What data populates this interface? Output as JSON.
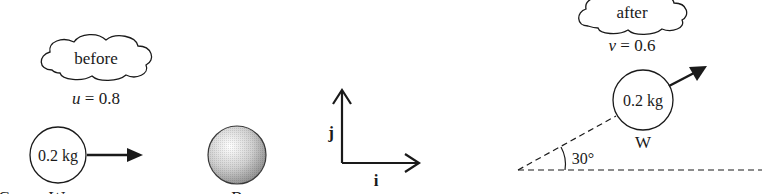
{
  "diagram": {
    "before": {
      "cloud_label": "before",
      "velocity_symbol": "u",
      "velocity_text": "u = 0.8",
      "ball_w": {
        "mass_label": "0.2 kg",
        "name": "W"
      },
      "ball_b": {
        "name": "B"
      },
      "edge_label": "C"
    },
    "axes": {
      "x_label": "i",
      "y_label": "j"
    },
    "after": {
      "cloud_label": "after",
      "velocity_symbol": "v",
      "velocity_text": "v = 0.6",
      "ball_w": {
        "mass_label": "0.2 kg",
        "name": "W"
      },
      "angle_label": "30°"
    },
    "colors": {
      "stroke": "#1a1a1a",
      "background": "#ffffff",
      "ball_b_fill": "#c8c8c8"
    }
  }
}
